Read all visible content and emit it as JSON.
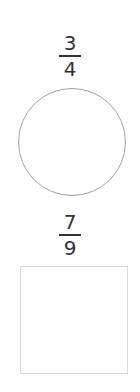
{
  "shapes": [
    {
      "fraction": {
        "numerator": "3",
        "denominator": "4"
      },
      "shape": "circle",
      "stroke_color": "#a0a0a0"
    },
    {
      "fraction": {
        "numerator": "7",
        "denominator": "9"
      },
      "shape": "square",
      "stroke_color": "#d8d8d8"
    }
  ]
}
